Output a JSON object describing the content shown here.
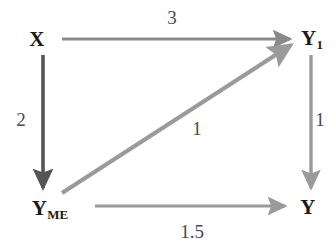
{
  "diagram": {
    "type": "path-diagram",
    "background_color": "#ffffff",
    "nodes": [
      {
        "id": "X",
        "label": "X",
        "subscript": "",
        "x": 37,
        "y": 39,
        "color": "#1a1a1a"
      },
      {
        "id": "Y1",
        "label": "Y",
        "subscript": "1",
        "x": 312,
        "y": 38,
        "color": "#1a1a1a"
      },
      {
        "id": "YME",
        "label": "Y",
        "subscript": "ME",
        "x": 50,
        "y": 208,
        "color": "#1a1a1a"
      },
      {
        "id": "Y",
        "label": "Y",
        "subscript": "",
        "x": 308,
        "y": 207,
        "color": "#1a1a1a"
      }
    ],
    "edges": [
      {
        "id": "x-to-y1",
        "from": "X",
        "to": "Y1",
        "label": "3",
        "label_x": 172,
        "label_y": 17,
        "color": "#8a8a8a"
      },
      {
        "id": "x-to-yme",
        "from": "X",
        "to": "YME",
        "label": "2",
        "label_x": 21,
        "label_y": 119,
        "color": "#555555"
      },
      {
        "id": "yme-to-y1",
        "from": "YME",
        "to": "Y1",
        "label": "1",
        "label_x": 197,
        "label_y": 128,
        "color": "#9a9a9a"
      },
      {
        "id": "y1-to-y",
        "from": "Y1",
        "to": "Y",
        "label": "1",
        "label_x": 320,
        "label_y": 119,
        "color": "#9a9a9a"
      },
      {
        "id": "yme-to-y",
        "from": "YME",
        "to": "Y",
        "label": "1.5",
        "label_x": 192,
        "label_y": 231,
        "color": "#9a9a9a"
      }
    ]
  }
}
